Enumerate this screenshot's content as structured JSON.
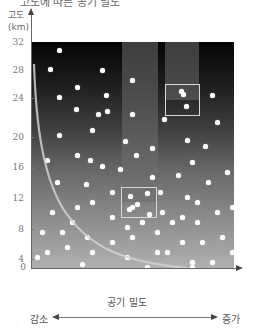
{
  "title_fragment": "고도에 따른 공기 밀도",
  "y_axis": {
    "label_line1": "고도",
    "label_line2": "(km)",
    "ticks": [
      "32",
      "28",
      "24",
      "20",
      "16",
      "12",
      "8",
      "4",
      "0"
    ],
    "range": [
      0,
      32
    ]
  },
  "x_axis": {
    "label": "공기 밀도",
    "left_label": "감소",
    "right_label": "증가"
  },
  "chart_data": {
    "type": "diagram",
    "title": "고도에 따른 공기 밀도",
    "ylabel": "고도 (km)",
    "xlabel": "공기 밀도",
    "ylim": [
      0,
      32
    ],
    "yticks": [
      0,
      4,
      8,
      12,
      16,
      20,
      24,
      28,
      32
    ],
    "x_direction": {
      "left": "감소",
      "right": "증가"
    },
    "annotations": [
      "Air molecules (white dots) dense near the ground, sparse at high altitude",
      "Box at ~11-13 km containing 5 molecules",
      "Box at ~23-26 km containing 2 molecules",
      "Curve showing air density decreasing with altitude"
    ],
    "sample_boxes": [
      {
        "altitude_km": "11-13",
        "molecules": 5
      },
      {
        "altitude_km": "23-26",
        "molecules": 2
      }
    ]
  },
  "colors": {
    "top_background": "#050505",
    "bottom_background": "#b0b0b0",
    "molecule": "#ffffff",
    "box_outline": "#d8d8d8"
  }
}
